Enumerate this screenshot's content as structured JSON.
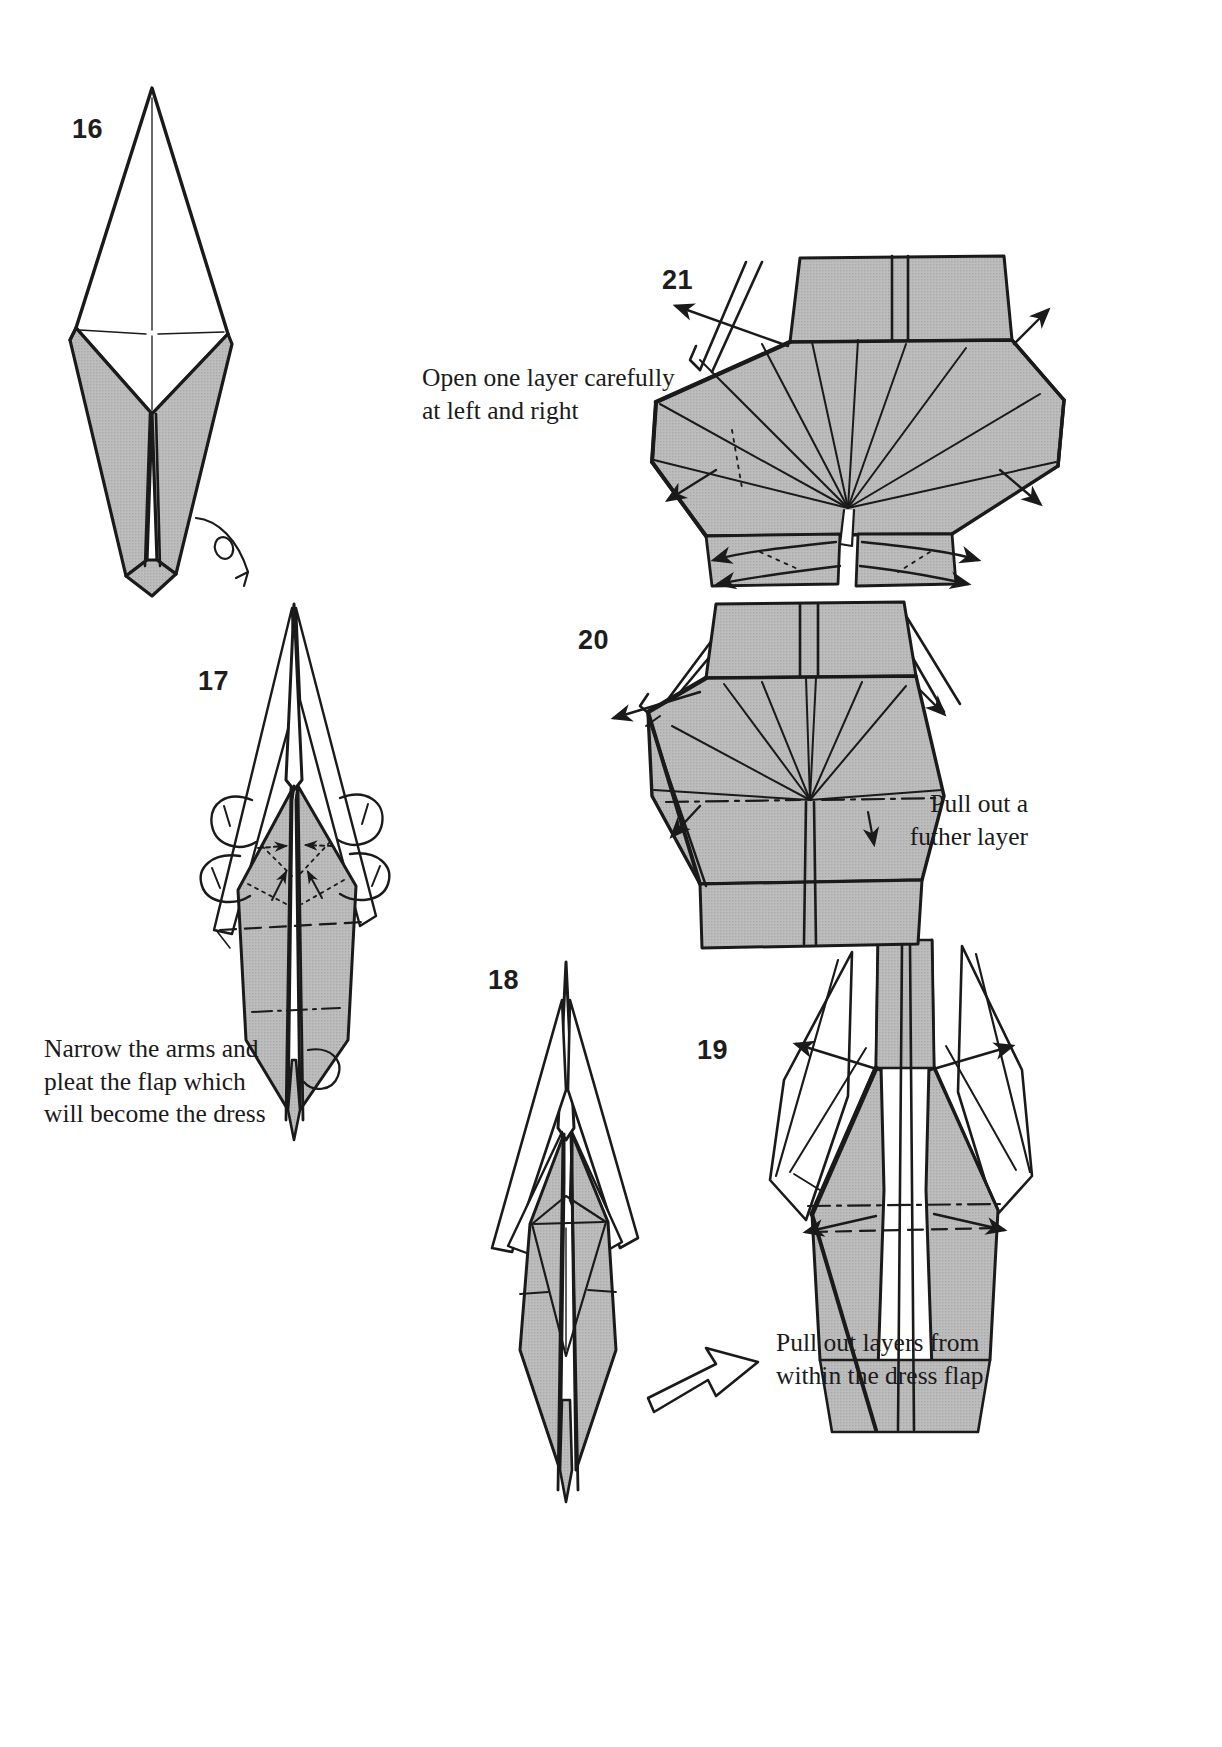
{
  "page": {
    "background": "#ffffff",
    "paper_fill": "#b9b9b9",
    "ink": "#1a1a1a",
    "width": 1222,
    "height": 1747
  },
  "steps": [
    {
      "number": "16",
      "name": "step-16",
      "description": "Narrow kite/diamond base seen from the front, white upper half and grey lower point"
    },
    {
      "number": "17",
      "name": "step-17",
      "description": "Model turned over; arms narrowed and dress flap pleated with rabbit-ear symbols at left and right"
    },
    {
      "number": "18",
      "name": "step-18",
      "description": "Result after narrowing the arms; slim body with grey dress flap"
    },
    {
      "number": "19",
      "name": "step-19",
      "description": "Body with dress flap; arrows show layers pulled out at left and right"
    },
    {
      "number": "20",
      "name": "step-20",
      "description": "Dress partly spread into a fan of pleats"
    },
    {
      "number": "21",
      "name": "step-21",
      "description": "Dress fully spread into a wide pleated skirt"
    }
  ],
  "captions": [
    {
      "name": "caption-open-one-layer",
      "text": "Open one layer carefully\nat left and right",
      "align": "left"
    },
    {
      "name": "caption-pull-out-further-layer",
      "text": "Pull out a\nfuther layer",
      "align": "right"
    },
    {
      "name": "caption-narrow-arms",
      "text": "Narrow the arms and\npleat the flap which\nwill become the dress",
      "align": "left"
    },
    {
      "name": "caption-pull-out-layers",
      "text": "Pull out layers from\nwithin the dress flap",
      "align": "left"
    }
  ],
  "symbols": [
    {
      "name": "turn-over-arrow",
      "meaning": "turn the model over"
    },
    {
      "name": "open-arrow",
      "meaning": "pull out layers from within"
    },
    {
      "name": "rabbit-ear-symbol",
      "meaning": "narrow the flap"
    },
    {
      "name": "valley-fold-line",
      "meaning": "dashed line"
    },
    {
      "name": "mountain-fold-line",
      "meaning": "dash-dot line"
    }
  ]
}
